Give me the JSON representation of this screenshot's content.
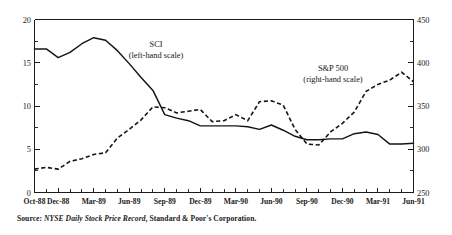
{
  "figure": {
    "source_prefix": "Source:",
    "source_italic": "NYSE Daily Stock Price Record",
    "source_rest": ", Standard & Poor's Corporation."
  },
  "annotations": {
    "sci_label_line1": "SCI",
    "sci_label_line2": "(left-hand scale)",
    "sp_label_line1": "S&P 500",
    "sp_label_line2": "(right-hand scale)"
  },
  "chart_data": {
    "type": "line",
    "title": "",
    "xlabel": "",
    "grid": false,
    "legend": "inline-annotations",
    "x": [
      "Oct-88",
      "Nov-88",
      "Dec-88",
      "Jan-89",
      "Feb-89",
      "Mar-89",
      "Apr-89",
      "May-89",
      "Jun-89",
      "Jul-89",
      "Aug-89",
      "Sep-89",
      "Oct-89",
      "Nov-89",
      "Dec-89",
      "Jan-90",
      "Feb-90",
      "Mar-90",
      "Apr-90",
      "May-90",
      "Jun-90",
      "Jul-90",
      "Aug-90",
      "Sep-90",
      "Oct-90",
      "Nov-90",
      "Dec-90",
      "Jan-91",
      "Feb-91",
      "Mar-91",
      "Apr-91",
      "May-91",
      "Jun-91"
    ],
    "xtick_labels": [
      "Oct-88",
      "Dec-88",
      "Mar-89",
      "Jun-89",
      "Sep-89",
      "Dec-89",
      "Mar-90",
      "Jun-90",
      "Sep-90",
      "Dec-90",
      "Mar-91",
      "Jun-91"
    ],
    "xtick_indices": [
      0,
      2,
      5,
      8,
      11,
      14,
      17,
      20,
      23,
      26,
      29,
      32
    ],
    "left_axis": {
      "label": "SCI (left-hand scale)",
      "ylim": [
        0,
        20
      ],
      "ticks": [
        0,
        5,
        10,
        15,
        20
      ],
      "minor_step": 2.5
    },
    "right_axis": {
      "label": "S&P 500 (right-hand scale)",
      "ylim": [
        250,
        450
      ],
      "ticks": [
        250,
        300,
        350,
        400,
        450
      ],
      "minor_step": 25
    },
    "series": [
      {
        "name": "SCI",
        "axis": "left",
        "style": "solid",
        "values": [
          16.6,
          16.6,
          15.6,
          16.2,
          17.2,
          17.9,
          17.6,
          16.4,
          14.9,
          13.3,
          11.8,
          9.0,
          8.6,
          8.3,
          7.7,
          7.7,
          7.7,
          7.7,
          7.6,
          7.3,
          7.8,
          7.2,
          6.5,
          6.1,
          6.1,
          6.2,
          6.2,
          6.8,
          7.0,
          6.7,
          5.6,
          5.6,
          5.7
        ]
      },
      {
        "name": "S&P 500",
        "axis": "right",
        "style": "dashed",
        "values": [
          277,
          279,
          277,
          286,
          289,
          294,
          296,
          313,
          323,
          334,
          349,
          348,
          342,
          344,
          346,
          332,
          333,
          340,
          333,
          355,
          356,
          351,
          323,
          306,
          305,
          320,
          330,
          343,
          367,
          375,
          380,
          389,
          378
        ]
      }
    ]
  }
}
